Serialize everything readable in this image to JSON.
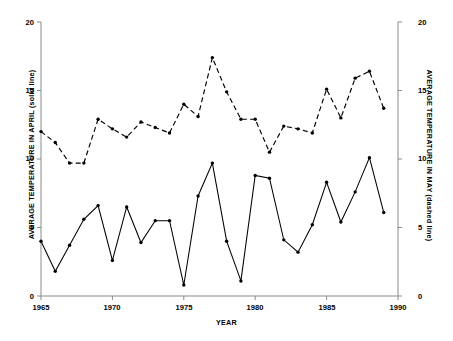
{
  "chart_data": {
    "type": "line",
    "title": "",
    "xlabel": "YEAR",
    "ylabel_left": "AVERAGE TEMPERATURE IN APRIL (solid line)",
    "ylabel_right": "AVERAGE TEMPERATURE IN MAY (dashed line)",
    "xlim": [
      1965,
      1990
    ],
    "ylim": [
      0,
      20
    ],
    "ylim_right": [
      0,
      20
    ],
    "grid": false,
    "legend": "none",
    "xticks": [
      1965,
      1970,
      1975,
      1980,
      1985,
      1990
    ],
    "yticks_left": [
      0,
      5,
      10,
      15,
      20
    ],
    "yticks_right": [
      0,
      5,
      10,
      15,
      20
    ],
    "x": [
      1965,
      1966,
      1967,
      1968,
      1969,
      1970,
      1971,
      1972,
      1973,
      1974,
      1975,
      1976,
      1977,
      1978,
      1979,
      1980,
      1981,
      1982,
      1983,
      1984,
      1985,
      1986,
      1987,
      1988,
      1989
    ],
    "series": [
      {
        "name": "AVERAGE TEMPERATURE IN APRIL",
        "style": "solid",
        "axis": "left",
        "marker": "filled-circle",
        "values": [
          4.0,
          1.8,
          3.7,
          5.6,
          6.6,
          2.6,
          6.5,
          3.9,
          5.5,
          5.5,
          0.8,
          7.3,
          9.7,
          4.0,
          1.1,
          8.8,
          8.6,
          4.1,
          3.2,
          5.2,
          8.3,
          5.4,
          7.6,
          10.1,
          6.1
        ]
      },
      {
        "name": "AVERAGE TEMPERATURE IN MAY",
        "style": "dashed",
        "axis": "right",
        "marker": "filled-circle",
        "values": [
          12.0,
          11.2,
          9.7,
          9.7,
          12.9,
          12.2,
          11.6,
          12.7,
          12.3,
          11.9,
          14.0,
          13.1,
          17.4,
          14.9,
          12.9,
          12.9,
          10.5,
          12.4,
          12.2,
          11.9,
          15.1,
          13.0,
          15.9,
          16.4,
          13.7
        ]
      }
    ],
    "tick_label_strings": {
      "x": [
        "1965",
        "1970",
        "1975",
        "1980",
        "1985",
        "1990"
      ],
      "y_left": [
        "0",
        "5",
        "10",
        "15",
        "20"
      ],
      "y_right": [
        "0",
        "5",
        "10",
        "15",
        "20"
      ]
    }
  }
}
